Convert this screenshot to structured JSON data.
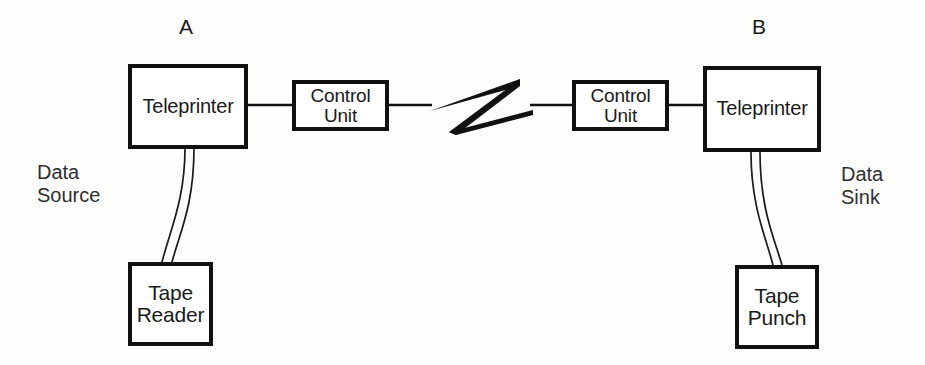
{
  "diagram": {
    "background_color": "#fdfdfc",
    "line_color": "#111111",
    "text_color": "#1a1a1a",
    "terminals": [
      {
        "id": "terminal-a",
        "label": "A"
      },
      {
        "id": "terminal-b",
        "label": "B"
      }
    ],
    "endpoint_roles": [
      {
        "id": "data-source",
        "label": "Data\nSource"
      },
      {
        "id": "data-sink",
        "label": "Data\nSink"
      }
    ],
    "nodes": [
      {
        "id": "teleprinter-a",
        "label": "Teleprinter"
      },
      {
        "id": "control-unit-a",
        "label": "Control\nUnit"
      },
      {
        "id": "control-unit-b",
        "label": "Control\nUnit"
      },
      {
        "id": "teleprinter-b",
        "label": "Teleprinter"
      },
      {
        "id": "tape-reader",
        "label": "Tape\nReader"
      },
      {
        "id": "tape-punch",
        "label": "Tape\nPunch"
      }
    ],
    "link_symbol": {
      "id": "transmission-link-bolt",
      "shape": "lightning-bolt-z",
      "meaning": "transmission line"
    },
    "connections": [
      {
        "from": "teleprinter-a",
        "to": "control-unit-a",
        "style": "solid-line"
      },
      {
        "from": "control-unit-a",
        "to": "transmission-link-bolt",
        "style": "solid-line"
      },
      {
        "from": "transmission-link-bolt",
        "to": "control-unit-b",
        "style": "solid-line"
      },
      {
        "from": "control-unit-b",
        "to": "teleprinter-b",
        "style": "solid-line"
      },
      {
        "from": "teleprinter-a",
        "to": "tape-reader",
        "style": "paper-tape-curve"
      },
      {
        "from": "teleprinter-b",
        "to": "tape-punch",
        "style": "paper-tape-curve"
      }
    ]
  }
}
